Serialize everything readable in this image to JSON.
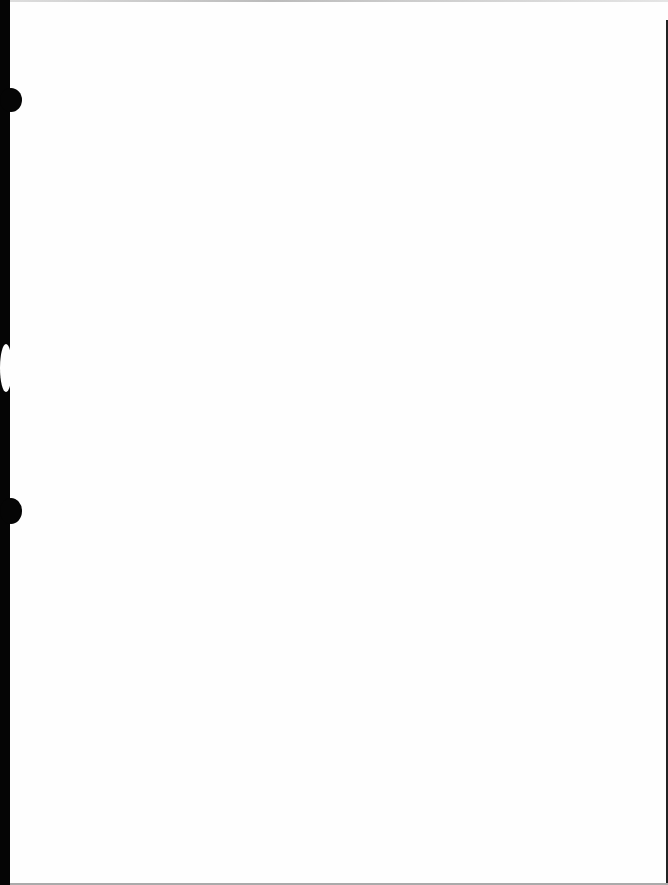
{
  "document": {
    "type": "scanned-blank-page",
    "content": "",
    "colors": {
      "paper": "#fefefe",
      "margin": "#050505"
    }
  }
}
